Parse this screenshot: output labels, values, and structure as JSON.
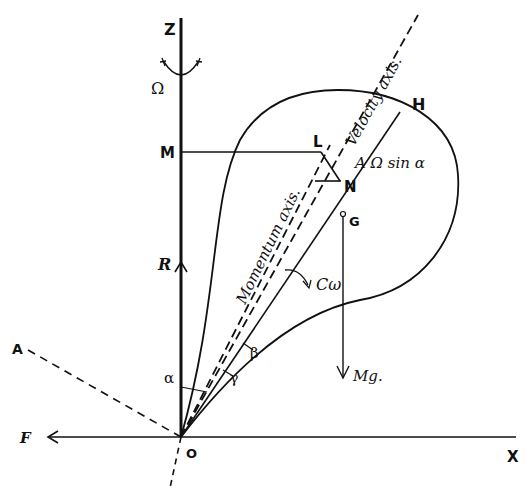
{
  "figure": {
    "points": {
      "Z": "Z",
      "M": "M",
      "L": "L",
      "H": "H",
      "N": "N",
      "G": "G",
      "O": "O",
      "X": "X",
      "A": "A"
    },
    "forces": {
      "R": "R",
      "F": "F",
      "Mg": "Mg.",
      "C_omega": "Cω"
    },
    "angles": {
      "alpha": "α",
      "beta": "β",
      "gamma": "γ"
    },
    "rotation": {
      "Omega": "Ω"
    },
    "annotations": {
      "A_Omega_sin_alpha": "A Ω sin α",
      "velocity_axis": "Velocity axis.",
      "momentum_axis": "Momentum axis."
    }
  }
}
